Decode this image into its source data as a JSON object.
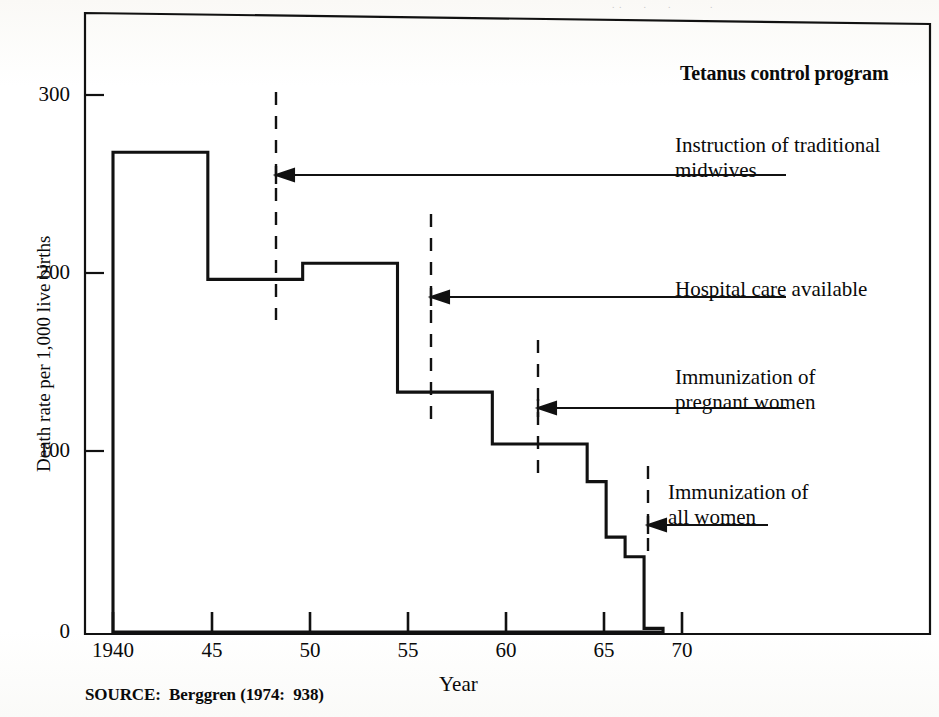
{
  "figure": {
    "source_note": "SOURCE:  Berggren (1974:  938)",
    "top_cutoff_trace": ". .      .      .           ."
  },
  "chart_data": {
    "type": "bar",
    "title": "",
    "xlabel": "Year",
    "ylabel": "Death rate per 1,000 live births",
    "xlim": [
      1940,
      1972
    ],
    "ylim": [
      0,
      330
    ],
    "yticks": [
      0,
      100,
      200,
      300
    ],
    "ytick_labels": [
      "0",
      "100",
      "200",
      "300"
    ],
    "xticks": [
      1940,
      1945,
      1950,
      1955,
      1960,
      1965,
      1970
    ],
    "xtick_labels": [
      "1940",
      "45",
      "50",
      "55",
      "60",
      "65",
      "70"
    ],
    "grid": false,
    "legend": "none",
    "bar_style": "step-histogram-outline",
    "bins": [
      {
        "label": "1940",
        "x_start": 1940,
        "x_end": 1945,
        "value": 268
      },
      {
        "label": "45",
        "x_start": 1945,
        "x_end": 1950,
        "value": 197
      },
      {
        "label": "50",
        "x_start": 1950,
        "x_end": 1955,
        "value": 206
      },
      {
        "label": "55",
        "x_start": 1955,
        "x_end": 1960,
        "value": 134
      },
      {
        "label": "60",
        "x_start": 1960,
        "x_end": 1965,
        "value": 105
      },
      {
        "label": "65",
        "x_start": 1965,
        "x_end": 1966,
        "value": 84
      },
      {
        "label": "66",
        "x_start": 1966,
        "x_end": 1967,
        "value": 53
      },
      {
        "label": "67",
        "x_start": 1967,
        "x_end": 1968,
        "value": 42
      },
      {
        "label": "68",
        "x_start": 1968,
        "x_end": 1969,
        "value": 2
      }
    ],
    "annotations": [
      {
        "id": "heading",
        "text": "Tetanus control program",
        "bold": true,
        "marker": "none",
        "marker_year": null
      },
      {
        "id": "midwives",
        "text_line1": "Instruction of traditional",
        "text_line2": "midwives",
        "bold": false,
        "marker": "dashed-vertical",
        "marker_year": 1948.5
      },
      {
        "id": "hospital",
        "text_line1": "Hospital care available",
        "text_line2": "",
        "bold": false,
        "marker": "dashed-vertical",
        "marker_year": 1956.3
      },
      {
        "id": "pregnant",
        "text_line1": "Immunization of",
        "text_line2": "pregnant women",
        "bold": false,
        "marker": "dashed-vertical",
        "marker_year": 1962.0
      },
      {
        "id": "allwomen",
        "text_line1": "Immunization of",
        "text_line2": "all women",
        "bold": false,
        "marker": "dashed-vertical",
        "marker_year": 1967.9
      }
    ]
  },
  "colors": {
    "ink": "#0a0a0a",
    "paper": "#ffffff"
  }
}
